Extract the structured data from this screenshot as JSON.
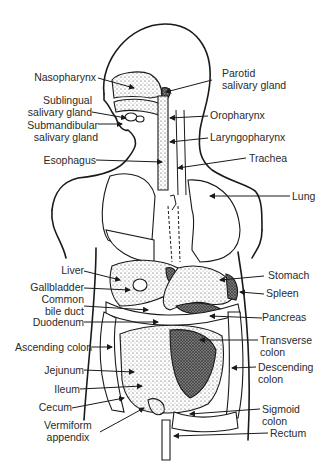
{
  "figure": {
    "labels_left": [
      {
        "id": "nasopharynx",
        "text": "Nasopharynx"
      },
      {
        "id": "sublingual",
        "text": "Sublingual\nsalivary gland"
      },
      {
        "id": "submandibular",
        "text": "Submandibular\nsalivary gland"
      },
      {
        "id": "esophagus",
        "text": "Esophagus"
      },
      {
        "id": "liver",
        "text": "Liver"
      },
      {
        "id": "gallbladder",
        "text": "Gallbladder"
      },
      {
        "id": "common_bile_duct",
        "text": "Common\nbile duct"
      },
      {
        "id": "duodenum",
        "text": "Duodenum"
      },
      {
        "id": "ascending_colon",
        "text": "Ascending colon"
      },
      {
        "id": "jejunum",
        "text": "Jejunum"
      },
      {
        "id": "ileum",
        "text": "Ileum"
      },
      {
        "id": "cecum",
        "text": "Cecum"
      },
      {
        "id": "vermiform_appendix",
        "text": "Vermiform\nappendix"
      }
    ],
    "labels_right": [
      {
        "id": "parotid",
        "text": "Parotid\nsalivary gland"
      },
      {
        "id": "oropharynx",
        "text": "Oropharynx"
      },
      {
        "id": "laryngopharynx",
        "text": "Laryngopharynx"
      },
      {
        "id": "trachea",
        "text": "Trachea"
      },
      {
        "id": "lung",
        "text": "Lung"
      },
      {
        "id": "stomach",
        "text": "Stomach"
      },
      {
        "id": "spleen",
        "text": "Spleen"
      },
      {
        "id": "pancreas",
        "text": "Pancreas"
      },
      {
        "id": "transverse_colon",
        "text": "Transverse\ncolon"
      },
      {
        "id": "descending_colon",
        "text": "Descending\ncolon"
      },
      {
        "id": "sigmoid_colon",
        "text": "Sigmoid\ncolon"
      },
      {
        "id": "rectum",
        "text": "Rectum"
      }
    ]
  }
}
